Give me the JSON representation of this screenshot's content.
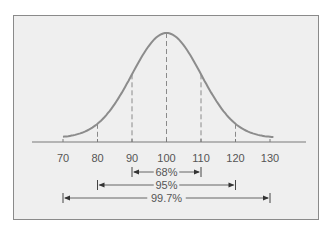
{
  "chart_data": {
    "type": "line",
    "title": "",
    "xlabel": "",
    "ylabel": "",
    "x_ticks": [
      70,
      80,
      90,
      100,
      110,
      120,
      130
    ],
    "xlim": [
      70,
      130
    ],
    "grid": false,
    "legend": null,
    "mean": 100,
    "std_dev": 10,
    "dashed_lines_at": [
      80,
      90,
      100,
      110,
      120
    ],
    "intervals": [
      {
        "label": "68%",
        "from": 90,
        "to": 110
      },
      {
        "label": "95%",
        "from": 80,
        "to": 120
      },
      {
        "label": "99.7%",
        "from": 70,
        "to": 130
      }
    ],
    "colors": {
      "curve": "#8c8c8c",
      "axis": "#7a7a7a",
      "dashed": "#8a8a8a",
      "background": "#efefef",
      "frame": "#8a8a8a",
      "text": "#555555"
    }
  }
}
